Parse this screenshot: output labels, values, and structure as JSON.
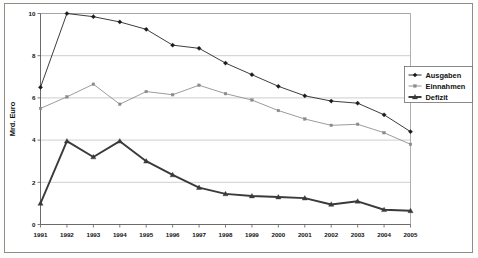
{
  "chart_data": {
    "type": "line",
    "title": "",
    "xlabel": "",
    "ylabel": "Mrd. Euro",
    "ylim": [
      0,
      10
    ],
    "yticks": [
      0,
      2,
      4,
      6,
      8,
      10
    ],
    "grid": true,
    "legend_position": "right",
    "categories": [
      "1991",
      "1992",
      "1993",
      "1994",
      "1995",
      "1996",
      "1997",
      "1998",
      "1999",
      "2000",
      "2001",
      "2002",
      "2003",
      "2004",
      "2005"
    ],
    "series": [
      {
        "name": "Ausgaben",
        "color": "#1a1a1a",
        "marker": "diamond",
        "values": [
          6.5,
          10.0,
          9.85,
          9.6,
          9.25,
          8.5,
          8.35,
          7.65,
          7.1,
          6.55,
          6.1,
          5.85,
          5.75,
          5.2,
          4.4
        ]
      },
      {
        "name": "Einnahmen",
        "color": "#8a8a8a",
        "marker": "square",
        "values": [
          5.5,
          6.05,
          6.65,
          5.7,
          6.3,
          6.15,
          6.6,
          6.2,
          5.9,
          5.4,
          5.0,
          4.7,
          4.75,
          4.35,
          3.8
        ]
      },
      {
        "name": "Defizit",
        "color": "#3a3a3a",
        "marker": "triangle",
        "values": [
          1.0,
          3.95,
          3.2,
          3.95,
          3.0,
          2.35,
          1.75,
          1.45,
          1.35,
          1.3,
          1.25,
          0.95,
          1.1,
          0.7,
          0.65
        ]
      }
    ]
  },
  "legend": {
    "items": [
      {
        "label": "Ausgaben"
      },
      {
        "label": "Einnahmen"
      },
      {
        "label": "Defizit"
      }
    ]
  }
}
